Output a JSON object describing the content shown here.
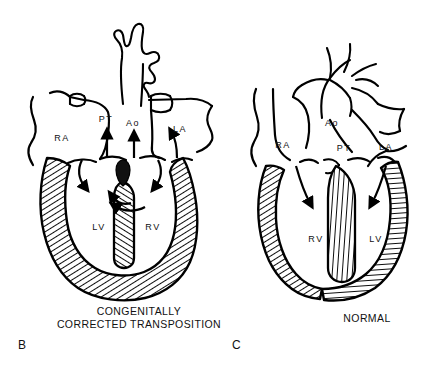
{
  "figure": {
    "background_color": "#ffffff",
    "ink_color": "#000000",
    "width": 441,
    "height": 365
  },
  "panels": [
    {
      "id": "B",
      "panel_letter": "B",
      "caption_line1": "CONGENITALLY",
      "caption_line2": "CORRECTED TRANSPOSITION",
      "labels": {
        "right_atrium": "RA",
        "pulmonary_trunk": "PT",
        "aorta": "Ao",
        "left_atrium": "LA",
        "left_ventricle": "LV",
        "right_ventricle": "RV"
      }
    },
    {
      "id": "C",
      "panel_letter": "C",
      "caption_line1": "NORMAL",
      "caption_line2": "",
      "labels": {
        "right_atrium": "RA",
        "aorta": "Ao",
        "pulmonary_trunk": "PT",
        "left_atrium": "LA",
        "right_ventricle": "RV",
        "left_ventricle": "LV"
      }
    }
  ]
}
